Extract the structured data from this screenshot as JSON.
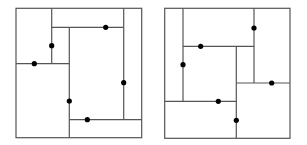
{
  "colors": {
    "line": "#555555",
    "dot": "#000000",
    "background": "#ffffff"
  },
  "diagrams": [
    {
      "name": "left-floorplan",
      "outer": {
        "x1": 16,
        "y1": 8.3,
        "x2": 141.7,
        "y2": 137.7
      },
      "segments": [
        {
          "x1": 51.7,
          "y1": 8.3,
          "x2": 51.7,
          "y2": 63.7
        },
        {
          "x1": 51.7,
          "y1": 27.3,
          "x2": 123.7,
          "y2": 27.3
        },
        {
          "x1": 123.7,
          "y1": 8.3,
          "x2": 123.7,
          "y2": 119.7
        },
        {
          "x1": 16,
          "y1": 63.7,
          "x2": 69.3,
          "y2": 63.7
        },
        {
          "x1": 69.3,
          "y1": 27.3,
          "x2": 69.3,
          "y2": 137.7
        },
        {
          "x1": 69.3,
          "y1": 119.7,
          "x2": 141.7,
          "y2": 119.7
        }
      ],
      "dots": [
        {
          "x": 105.7,
          "y": 27.3
        },
        {
          "x": 51.7,
          "y": 45.7
        },
        {
          "x": 34.3,
          "y": 63.7
        },
        {
          "x": 123.7,
          "y": 82.7
        },
        {
          "x": 69.3,
          "y": 101
        },
        {
          "x": 87.3,
          "y": 119.7
        }
      ]
    },
    {
      "name": "right-floorplan",
      "outer": {
        "x1": 164.7,
        "y1": 8.3,
        "x2": 290,
        "y2": 138.3
      },
      "segments": [
        {
          "x1": 183,
          "y1": 8.3,
          "x2": 183,
          "y2": 101.3
        },
        {
          "x1": 254,
          "y1": 8.3,
          "x2": 254,
          "y2": 83
        },
        {
          "x1": 183,
          "y1": 46.3,
          "x2": 254,
          "y2": 46.3
        },
        {
          "x1": 236.3,
          "y1": 46.3,
          "x2": 236.3,
          "y2": 138.3
        },
        {
          "x1": 236.3,
          "y1": 83,
          "x2": 290,
          "y2": 83
        },
        {
          "x1": 164.7,
          "y1": 101.3,
          "x2": 236.3,
          "y2": 101.3
        }
      ],
      "dots": [
        {
          "x": 254,
          "y": 28
        },
        {
          "x": 200.7,
          "y": 46.3
        },
        {
          "x": 183,
          "y": 64.7
        },
        {
          "x": 271.7,
          "y": 83
        },
        {
          "x": 218.3,
          "y": 101.3
        },
        {
          "x": 236.3,
          "y": 120.3
        }
      ]
    }
  ]
}
